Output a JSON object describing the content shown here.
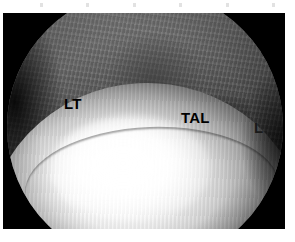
{
  "figure": {
    "modality": "arthroscopy",
    "field_of_view": "circular",
    "frame_background": "#000000",
    "page_background": "#ffffff"
  },
  "annotations": [
    {
      "id": "lt",
      "text": "LT",
      "meaning": "lateral talus / labeled structure LT",
      "color": "#000000"
    },
    {
      "id": "tal",
      "text": "TAL",
      "meaning": "talus",
      "color": "#000000"
    },
    {
      "id": "l",
      "text": "L",
      "meaning": "ligament / lateral marker",
      "color": "#1a1a1a"
    }
  ],
  "regions": {
    "upper_tissue": "fibrous soft tissue",
    "lower_structure": "bright convex talar dome",
    "left_recess": "shadowed joint recess",
    "right_gutter": "shadowed lateral gutter"
  },
  "colors": {
    "frame": "#000000",
    "highlight": "#ffffff",
    "tissue_mid": "#969696",
    "tissue_dark": "#2e2e2e",
    "label": "#000000"
  }
}
